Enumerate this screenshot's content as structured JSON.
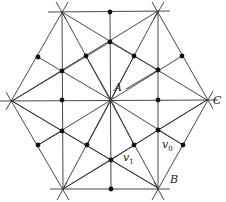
{
  "diagram": {
    "type": "hexagonal triangulation with barycentric subdivision",
    "colors": {
      "line": "#333333",
      "dot": "#111111",
      "label": "#222222"
    },
    "vertices": {
      "A": [
        111,
        100
      ],
      "top_left": [
        62,
        12
      ],
      "top_right": [
        158,
        11
      ],
      "C": [
        207,
        100
      ],
      "B": [
        158,
        188
      ],
      "bottom_left": [
        63,
        189
      ],
      "left": [
        12,
        101
      ]
    },
    "labels": [
      {
        "id": "A",
        "text": "A",
        "x": 114,
        "y": 88
      },
      {
        "id": "C",
        "text": "C",
        "x": 214,
        "y": 96
      },
      {
        "id": "B",
        "text": "B",
        "x": 170,
        "y": 176
      },
      {
        "id": "v0",
        "text": "v",
        "sub": "0",
        "x": 161,
        "y": 142
      },
      {
        "id": "v1",
        "text": "v",
        "sub": "1",
        "x": 124,
        "y": 154
      }
    ],
    "dots": [
      [
        110,
        12
      ],
      [
        110,
        42
      ],
      [
        38,
        57
      ],
      [
        86,
        56
      ],
      [
        134,
        56
      ],
      [
        182,
        56
      ],
      [
        62,
        71
      ],
      [
        158,
        70
      ],
      [
        62,
        100
      ],
      [
        158,
        100
      ],
      [
        62,
        131
      ],
      [
        158,
        130
      ],
      [
        38,
        145
      ],
      [
        87,
        145
      ],
      [
        134,
        145
      ],
      [
        183,
        145
      ],
      [
        111,
        160
      ],
      [
        111,
        189
      ]
    ]
  }
}
